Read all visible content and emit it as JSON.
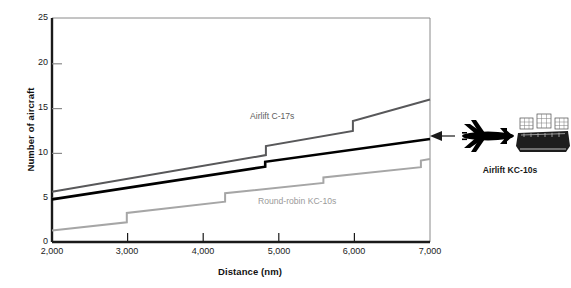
{
  "chart_data": {
    "type": "line",
    "title": "",
    "xlabel": "Distance (nm)",
    "ylabel": "Number of aircraft",
    "xlim": [
      2000,
      7000
    ],
    "ylim": [
      0,
      25
    ],
    "xticks": [
      "2,000",
      "3,000",
      "4,000",
      "5,000",
      "6,000",
      "7,000"
    ],
    "xtick_values": [
      2000,
      3000,
      4000,
      5000,
      6000,
      7000
    ],
    "yticks": [
      "0",
      "5",
      "10",
      "15",
      "20",
      "25"
    ],
    "ytick_values": [
      0,
      5,
      10,
      15,
      20,
      25
    ],
    "grid": false,
    "legend": "inline-annotations",
    "series": [
      {
        "name": "Airlift C-17s",
        "color": "#58585a",
        "style": "step-with-slope",
        "points": [
          {
            "x": 2000,
            "y": 5.6
          },
          {
            "x": 4830,
            "y": 9.7
          },
          {
            "x": 4830,
            "y": 10.7
          },
          {
            "x": 5980,
            "y": 12.4
          },
          {
            "x": 5980,
            "y": 13.5
          },
          {
            "x": 7000,
            "y": 15.9
          }
        ]
      },
      {
        "name": "Airlift KC-10s",
        "color": "#000000",
        "style": "step-with-slope",
        "points": [
          {
            "x": 2000,
            "y": 4.75
          },
          {
            "x": 4820,
            "y": 8.4
          },
          {
            "x": 4820,
            "y": 8.95
          },
          {
            "x": 7000,
            "y": 11.5
          }
        ]
      },
      {
        "name": "Round-robin KC-10s",
        "color": "#a6a6a6",
        "style": "step-with-slope",
        "points": [
          {
            "x": 2000,
            "y": 1.3
          },
          {
            "x": 2990,
            "y": 2.2
          },
          {
            "x": 2990,
            "y": 3.25
          },
          {
            "x": 4290,
            "y": 4.5
          },
          {
            "x": 4290,
            "y": 5.45
          },
          {
            "x": 5590,
            "y": 6.6
          },
          {
            "x": 5590,
            "y": 7.2
          },
          {
            "x": 6880,
            "y": 8.35
          },
          {
            "x": 6880,
            "y": 9.1
          },
          {
            "x": 7000,
            "y": 9.25
          }
        ]
      }
    ],
    "annotations": [
      {
        "name": "Airlift C-17s",
        "text": "Airlift C-17s",
        "color": "#5e5e5e"
      },
      {
        "name": "Round-robin KC-10s",
        "text": "Round-robin KC-10s",
        "color": "#9a9a9a"
      },
      {
        "name": "Airlift KC-10s",
        "text": "Airlift KC-10s",
        "color": "#1a1a1a",
        "arrow": "points-left-to-black-line-at-x-7000"
      }
    ]
  },
  "axes": {
    "y_title": "Number of aircraft",
    "x_title": "Distance (nm)",
    "y_labels": [
      "25",
      "20",
      "15",
      "10",
      "5",
      "0"
    ],
    "x_labels": [
      "2,000",
      "3,000",
      "4,000",
      "5,000",
      "6,000",
      "7,000"
    ]
  },
  "callout": {
    "caption": "Airlift KC-10s",
    "plane_icon": "airplane-icon",
    "cargo_icon": "cargo-pallets-icon"
  },
  "series_labels": {
    "c17": "Airlift C-17s",
    "round_robin": "Round-robin KC-10s"
  },
  "colors": {
    "c17": "#58585a",
    "kc10_airlift": "#000000",
    "kc10_round_robin": "#a6a6a6",
    "axis": "#1a1a1a",
    "plot_border": "#6e6e6e"
  }
}
